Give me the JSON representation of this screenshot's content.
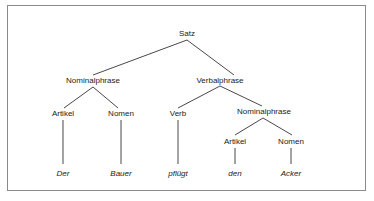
{
  "tree": {
    "root": "Satz",
    "np1": "Nominalphrase",
    "vp": "Verbalphrase",
    "art1": "Artikel",
    "nom1": "Nomen",
    "verb": "Verb",
    "np2": "Nominalphrase",
    "art2": "Artikel",
    "nom2": "Nomen"
  },
  "words": {
    "w1": "Der",
    "w2": "Bauer",
    "w3": "pflügt",
    "w4": "den",
    "w5": "Acker"
  }
}
